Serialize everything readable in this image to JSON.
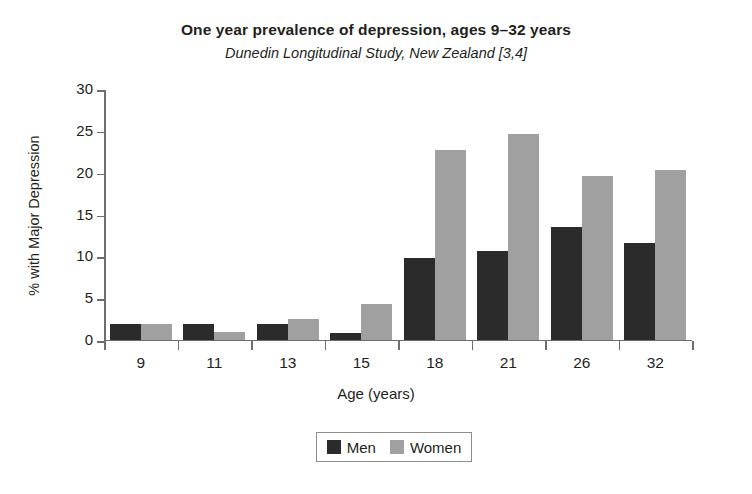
{
  "chart_data": {
    "type": "bar",
    "title": "One year prevalence of depression, ages 9–32 years",
    "subtitle": "Dunedin Longitudinal Study, New Zealand [3,4]",
    "xlabel": "Age (years)",
    "ylabel": "% with Major Depression",
    "categories": [
      "9",
      "11",
      "13",
      "15",
      "18",
      "21",
      "26",
      "32"
    ],
    "series": [
      {
        "name": "Men",
        "color": "#2b2b2b",
        "values": [
          1.9,
          1.9,
          1.8,
          0.8,
          9.8,
          10.6,
          13.5,
          11.5
        ]
      },
      {
        "name": "Women",
        "color": "#a0a0a0",
        "values": [
          1.9,
          0.9,
          2.4,
          4.3,
          22.7,
          24.6,
          19.5,
          20.3
        ]
      }
    ],
    "ylim": [
      0,
      30
    ],
    "yticks": [
      0,
      5,
      10,
      15,
      20,
      25,
      30
    ],
    "ytick_labels": [
      "0",
      "5",
      "10",
      "15",
      "20",
      "25",
      "30"
    ],
    "grid": false,
    "legend_position": "bottom-center",
    "axis_color": "#6d6e71",
    "background": "#ffffff"
  }
}
